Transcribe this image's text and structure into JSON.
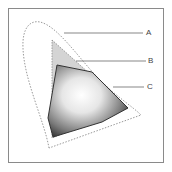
{
  "diagram": {
    "type": "color-gamut-comparison",
    "callouts": [
      {
        "id": "A",
        "label": "A",
        "target": "outer-visible-spectrum-boundary"
      },
      {
        "id": "B",
        "label": "B",
        "target": "dashed-triangle-gamut"
      },
      {
        "id": "C",
        "label": "C",
        "target": "solid-polygon-gamut"
      }
    ],
    "caption": "",
    "colors": {
      "frame": "#8a8a8a",
      "dashed_line": "#9a9a9a",
      "triangle_fill": "#d4d4d4",
      "leader_line": "#555555",
      "gamut_dark": "#2a2a2a",
      "gamut_light": "#f8f8f8"
    }
  }
}
